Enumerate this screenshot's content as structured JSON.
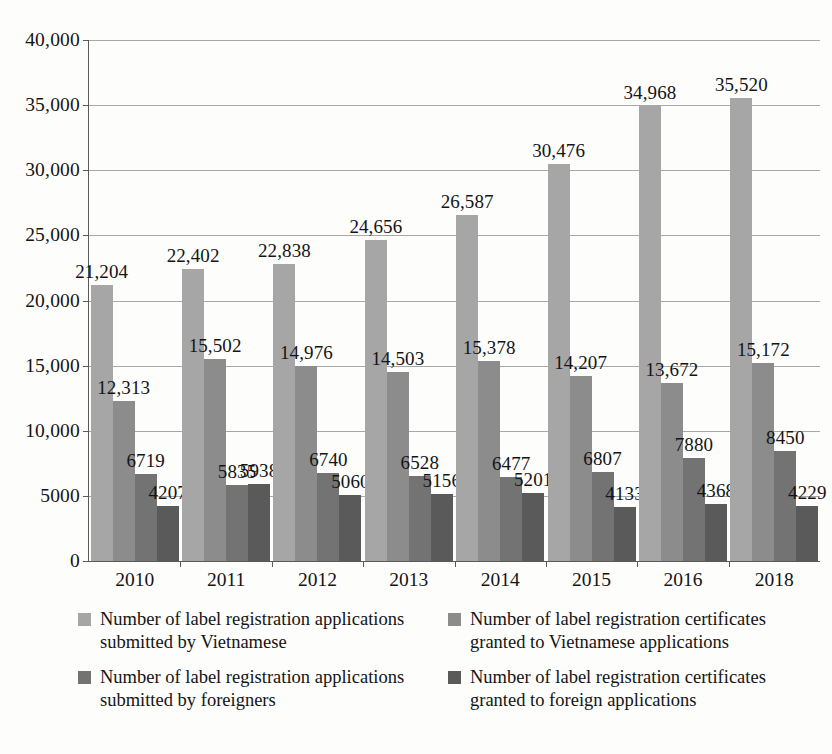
{
  "chart_data": {
    "type": "bar",
    "title": "",
    "subtitle": "",
    "xlabel": "",
    "ylabel": "",
    "categories": [
      "2010",
      "2011",
      "2012",
      "2013",
      "2014",
      "2015",
      "2016",
      "2018"
    ],
    "ylim": [
      0,
      40000
    ],
    "yticks": [
      0,
      5000,
      10000,
      15000,
      20000,
      25000,
      30000,
      35000,
      40000
    ],
    "ytick_labels": [
      "0",
      "5000",
      "10,000",
      "15,000",
      "20,000",
      "25,000",
      "30,000",
      "35,000",
      "40,000"
    ],
    "grid": true,
    "legend_position": "bottom",
    "series": [
      {
        "name": "Number of label registration applications submitted by Vietnamese",
        "color": "#a6a6a6",
        "values": [
          21204,
          22402,
          22838,
          24656,
          26587,
          30476,
          34968,
          35520
        ],
        "labels": [
          "21,204",
          "22,402",
          "22,838",
          "24,656",
          "26,587",
          "30,476",
          "34,968",
          "35,520"
        ]
      },
      {
        "name": "Number of label registration certificates granted to Vietnamese applications",
        "color": "#8c8c8c",
        "values": [
          12313,
          15502,
          14976,
          14503,
          15378,
          14207,
          13672,
          15172
        ],
        "labels": [
          "12,313",
          "15,502",
          "14,976",
          "14,503",
          "15,378",
          "14,207",
          "13,672",
          "15,172"
        ]
      },
      {
        "name": "Number of label registration applications submitted by foreigners",
        "color": "#737373",
        "values": [
          6719,
          5835,
          6740,
          6528,
          6477,
          6807,
          7880,
          8450
        ],
        "labels": [
          "6719",
          "5835",
          "6740",
          "6528",
          "6477",
          "6807",
          "7880",
          "8450"
        ]
      },
      {
        "name": "Number of label registration certificates granted to foreign applications",
        "color": "#5a5a5a",
        "values": [
          4207,
          5938,
          5060,
          5156,
          5201,
          4133,
          4368,
          4229
        ],
        "labels": [
          "4207",
          "5938",
          "5060",
          "5156",
          "5201",
          "4133",
          "4368",
          "4229"
        ]
      }
    ]
  },
  "legend": {
    "items": [
      {
        "label": "Number of label registration applications submitted by Vietnamese",
        "color": "#a6a6a6"
      },
      {
        "label": "Number of label registration certificates granted to Vietnamese applications",
        "color": "#8c8c8c"
      },
      {
        "label": "Number of label registration applications submitted by foreigners",
        "color": "#737373"
      },
      {
        "label": "Number of label registration certificates granted to foreign applications",
        "color": "#5a5a5a"
      }
    ]
  },
  "axis": {
    "y_max_label": "40,000",
    "y_min_label": "0"
  }
}
